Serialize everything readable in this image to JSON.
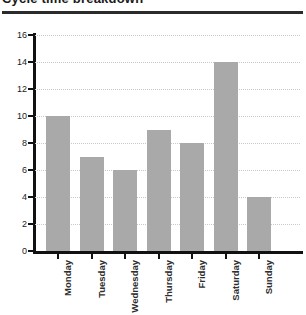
{
  "chart_data": {
    "type": "bar",
    "title": "Cycle time breakdown",
    "xlabel": "",
    "ylabel": "",
    "categories": [
      "Monday",
      "Tuesday",
      "Wednesday",
      "Thursday",
      "Friday",
      "Saturday",
      "Sunday"
    ],
    "values": [
      10,
      7,
      6,
      9,
      8,
      14,
      4
    ],
    "ylim": [
      0,
      16
    ],
    "ytick_values": [
      0,
      2,
      4,
      6,
      8,
      10,
      12,
      14,
      16
    ],
    "ytick_labels": [
      "0",
      "2",
      "4",
      "6",
      "8",
      "10",
      "12",
      "14",
      "16"
    ],
    "grid": true,
    "grid_axis": "y",
    "grid_style": "dotted",
    "legend": false,
    "bar_color": "#a9a9a9",
    "axis_color": "#111111",
    "grid_color": "#c9c9c9",
    "xtick_label_rotation": 90
  }
}
